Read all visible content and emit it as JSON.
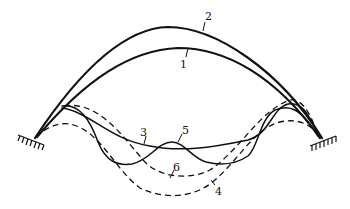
{
  "diagram": {
    "colors": {
      "line": "#111111",
      "background": "#ffffff"
    },
    "supports": [
      {
        "name": "left-fixed-support",
        "x": 35,
        "y": 138
      },
      {
        "name": "right-fixed-support",
        "x": 320,
        "y": 138
      }
    ],
    "curves": [
      {
        "id": "1",
        "label": "1",
        "style": "solid",
        "description": "original arch axis"
      },
      {
        "id": "2",
        "label": "2",
        "style": "solid",
        "description": "upper deformed arch"
      },
      {
        "id": "3",
        "label": "3",
        "style": "solid",
        "description": "symmetric buckling mode"
      },
      {
        "id": "4",
        "label": "4",
        "style": "dashed",
        "description": "deep symmetric mode"
      },
      {
        "id": "5",
        "label": "5",
        "style": "solid",
        "description": "wavy higher mode"
      },
      {
        "id": "6",
        "label": "6",
        "style": "dashed",
        "description": "intermediate dashed mode"
      }
    ],
    "labels": {
      "l1": "1",
      "l2": "2",
      "l3": "3",
      "l4": "4",
      "l5": "5",
      "l6": "6"
    }
  }
}
